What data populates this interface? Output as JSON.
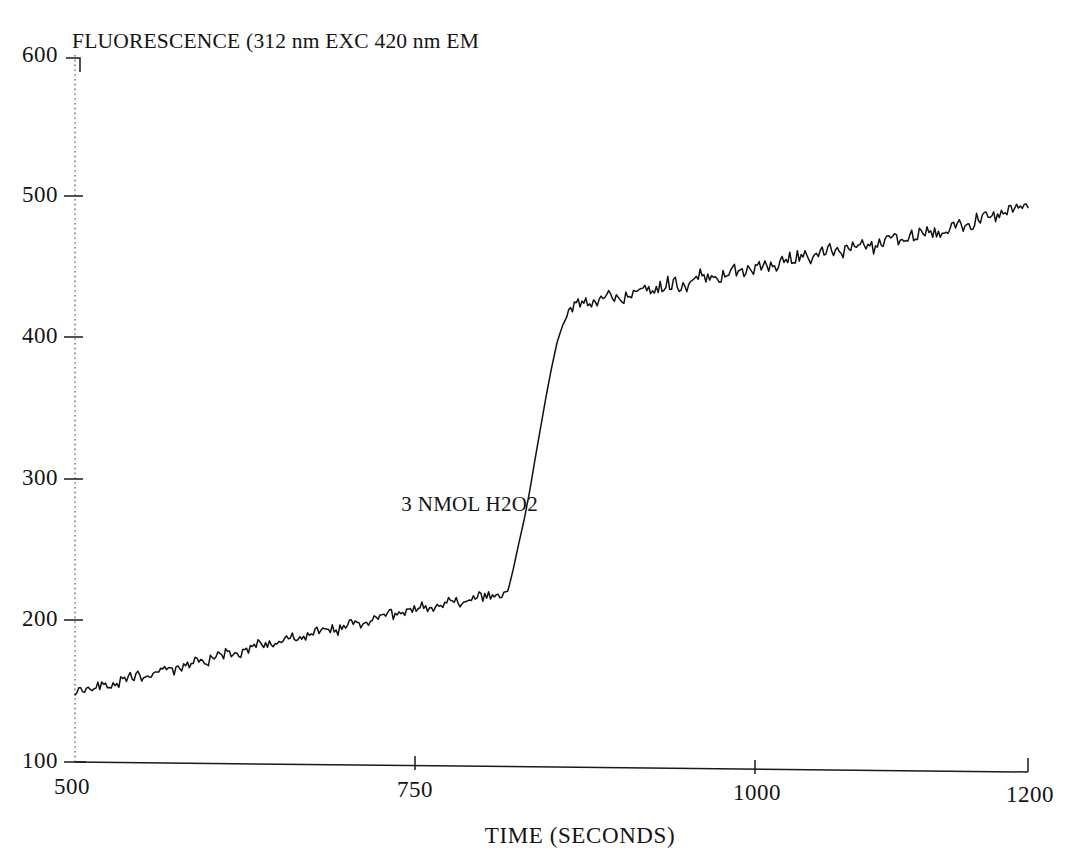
{
  "chart_data": {
    "type": "line",
    "title": "FLUORESCENCE (312 nm EXC  420 nm EM",
    "subtitle": "",
    "xlabel": "TIME (SECONDS)",
    "ylabel": "",
    "xlim": [
      500,
      1200
    ],
    "ylim": [
      100,
      600
    ],
    "xticks": [
      500,
      750,
      1000,
      1200
    ],
    "xtick_labels": [
      "500",
      "750",
      "1000",
      "1200"
    ],
    "yticks": [
      100,
      200,
      300,
      400,
      500,
      600
    ],
    "ytick_labels": [
      "100",
      "200",
      "300",
      "400",
      "500",
      "600"
    ],
    "grid": false,
    "legend": false,
    "legend_position": "none",
    "line_color": "#111111",
    "annotations": [
      {
        "text": "3 NMOL H2O2",
        "x": 815,
        "y": 280,
        "description": "injection of 3 nanomoles hydrogen peroxide causing step increase in fluorescence"
      }
    ],
    "series": [
      {
        "name": "fluorescence",
        "x": [
          500,
          510,
          520,
          530,
          540,
          550,
          560,
          570,
          580,
          590,
          600,
          610,
          620,
          630,
          640,
          650,
          660,
          670,
          680,
          690,
          700,
          710,
          720,
          730,
          740,
          750,
          760,
          770,
          780,
          790,
          800,
          810,
          818,
          822,
          826,
          830,
          834,
          838,
          842,
          846,
          850,
          854,
          858,
          862,
          866,
          870,
          880,
          890,
          900,
          910,
          920,
          930,
          940,
          950,
          960,
          970,
          980,
          990,
          1000,
          1010,
          1020,
          1030,
          1040,
          1050,
          1060,
          1070,
          1080,
          1090,
          1100,
          1110,
          1120,
          1130,
          1140,
          1150,
          1160,
          1170,
          1180,
          1190,
          1200
        ],
        "values": [
          150,
          152,
          154,
          157,
          159,
          162,
          164,
          167,
          169,
          172,
          174,
          177,
          179,
          182,
          184,
          187,
          189,
          192,
          194,
          196,
          199,
          201,
          203,
          206,
          208,
          210,
          212,
          214,
          216,
          218,
          220,
          222,
          224,
          240,
          258,
          275,
          295,
          318,
          340,
          362,
          382,
          400,
          412,
          420,
          424,
          427,
          430,
          432,
          434,
          436,
          438,
          440,
          442,
          444,
          446,
          448,
          450,
          452,
          455,
          457,
          459,
          461,
          463,
          465,
          467,
          469,
          471,
          473,
          475,
          477,
          479,
          481,
          483,
          486,
          489,
          492,
          495,
          498,
          500
        ]
      }
    ],
    "noise": {
      "description": "high-frequency sawtooth detector noise overlaid on the trend",
      "amplitude_units": 4
    },
    "baseline_drift": {
      "pre_injection_start": 150,
      "pre_injection_end": 225,
      "post_injection_start": 425,
      "post_injection_end": 500
    },
    "step": {
      "time_start": 816,
      "time_end": 866,
      "value_before": 225,
      "value_after": 425,
      "magnitude": 200
    }
  }
}
